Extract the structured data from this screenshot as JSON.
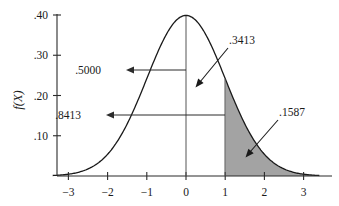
{
  "chart_data": {
    "type": "line",
    "title": "",
    "subtitle": "",
    "xlabel": "",
    "ylabel": "f(X)",
    "grid": false,
    "legend": "none",
    "distribution": "standard normal",
    "mean": 0,
    "sd": 1,
    "xlim": [
      -3.4,
      3.4
    ],
    "ylim": [
      0,
      0.42
    ],
    "x_ticks": [
      "-3",
      "-2",
      "-1",
      "0",
      "1",
      "2",
      "3"
    ],
    "x_tick_values": [
      -3,
      -2,
      -1,
      0,
      1,
      2,
      3
    ],
    "y_ticks": [
      ".40",
      ".30",
      ".20",
      ".10"
    ],
    "y_tick_values": [
      0.4,
      0.3,
      0.2,
      0.1
    ],
    "shaded_region": {
      "from": 1,
      "to": 3.4,
      "color": "#a3a3a3",
      "area_label": ".1587"
    },
    "annotations": [
      {
        "label": ".5000",
        "describes": "area from -infinity to 0",
        "value": 0.5
      },
      {
        "label": ".8413",
        "describes": "area from -infinity to 1",
        "value": 0.8413
      },
      {
        "label": ".3413",
        "describes": "area from 0 to 1",
        "value": 0.3413
      },
      {
        "label": ".1587",
        "describes": "area from 1 to +infinity",
        "value": 0.1587
      }
    ],
    "series": [
      {
        "name": "standard normal density",
        "x": [
          -3.4,
          -3,
          -2.5,
          -2,
          -1.5,
          -1,
          -0.5,
          0,
          0.5,
          1,
          1.5,
          2,
          2.5,
          3,
          3.4
        ],
        "values": [
          0.0012,
          0.0044,
          0.0175,
          0.054,
          0.1295,
          0.242,
          0.3521,
          0.3989,
          0.3521,
          0.242,
          0.1295,
          0.054,
          0.0175,
          0.0044,
          0.0012
        ]
      }
    ]
  },
  "colors": {
    "curve": "#1a1a1a",
    "axis": "#2b2b2b",
    "shade": "#a3a3a3",
    "background": "#ffffff"
  }
}
